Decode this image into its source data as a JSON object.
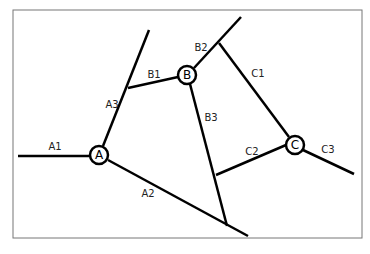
{
  "diagram": {
    "nodes": [
      {
        "id": "A",
        "label": "A",
        "x": 99,
        "y": 155
      },
      {
        "id": "B",
        "label": "B",
        "x": 187,
        "y": 75
      },
      {
        "id": "C",
        "label": "C",
        "x": 295,
        "y": 145
      }
    ],
    "edge_labels": {
      "A1": "A1",
      "A2": "A2",
      "A3": "A3",
      "B1": "B1",
      "B2": "B2",
      "B3": "B3",
      "C1": "C1",
      "C2": "C2",
      "C3": "C3"
    }
  }
}
